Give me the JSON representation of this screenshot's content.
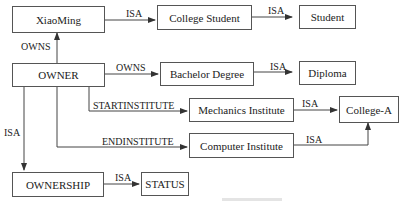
{
  "nodes": {
    "xiaoming": "XiaoMing",
    "college_student": "College Student",
    "student": "Student",
    "owner": "OWNER",
    "bachelor_degree": "Bachelor Degree",
    "diploma": "Diploma",
    "mechanics_institute": "Mechanics Institute",
    "college_a": "College-A",
    "computer_institute": "Computer Institute",
    "ownership": "OWNERSHIP",
    "status": "STATUS"
  },
  "edges": {
    "xiaoming_isa": "ISA",
    "college_student_isa": "ISA",
    "owner_owns_xiaoming": "OWNS",
    "owner_owns_degree": "OWNS",
    "degree_isa": "ISA",
    "startinstitute": "STARTINSTITUTE",
    "endinstitute": "ENDINSTITUTE",
    "mechanics_isa": "ISA",
    "computer_isa": "ISA",
    "owner_isa": "ISA",
    "ownership_isa": "ISA"
  },
  "colors": {
    "line": "#444444",
    "border": "#555555"
  }
}
